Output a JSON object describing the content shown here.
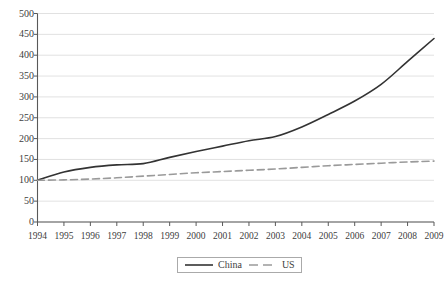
{
  "chart_data": {
    "type": "line",
    "title": "",
    "subtitle": "",
    "xlabel": "",
    "ylabel": "",
    "grid": true,
    "legend_position": "bottom",
    "xlim": [
      1994,
      2009
    ],
    "ylim": [
      0,
      500
    ],
    "ytick_step": 50,
    "x": [
      1994,
      1995,
      1996,
      1997,
      1998,
      1999,
      2000,
      2001,
      2002,
      2003,
      2004,
      2005,
      2006,
      2007,
      2008,
      2009
    ],
    "categories": [
      "1994",
      "1995",
      "1996",
      "1997",
      "1998",
      "1999",
      "2000",
      "2001",
      "2002",
      "2003",
      "2004",
      "2005",
      "2006",
      "2007",
      "2008",
      "2009"
    ],
    "ytick_labels": [
      "0",
      "50",
      "100",
      "150",
      "200",
      "250",
      "300",
      "350",
      "400",
      "450",
      "500"
    ],
    "ytick_values": [
      0,
      50,
      100,
      150,
      200,
      250,
      300,
      350,
      400,
      450,
      500
    ],
    "series": [
      {
        "name": "China",
        "style": "solid",
        "color": "#333333",
        "values": [
          100,
          120,
          131,
          137,
          140,
          155,
          169,
          182,
          195,
          205,
          228,
          258,
          290,
          330,
          385,
          440
        ]
      },
      {
        "name": "US",
        "style": "dashed",
        "color": "#9a9a9a",
        "values": [
          100,
          101,
          103,
          106,
          110,
          114,
          118,
          121,
          124,
          127,
          131,
          135,
          138,
          141,
          144,
          146
        ]
      }
    ],
    "annotations": []
  },
  "legend": {
    "items": [
      {
        "label": "China",
        "style": "solid",
        "color": "#333333"
      },
      {
        "label": "US",
        "style": "dashed",
        "color": "#9a9a9a"
      }
    ]
  },
  "colors": {
    "china_line": "#333333",
    "us_line": "#9a9a9a",
    "gridline": "#d9d9d9",
    "axis": "#595959",
    "background": "#ffffff",
    "text": "#3f3f3f"
  }
}
